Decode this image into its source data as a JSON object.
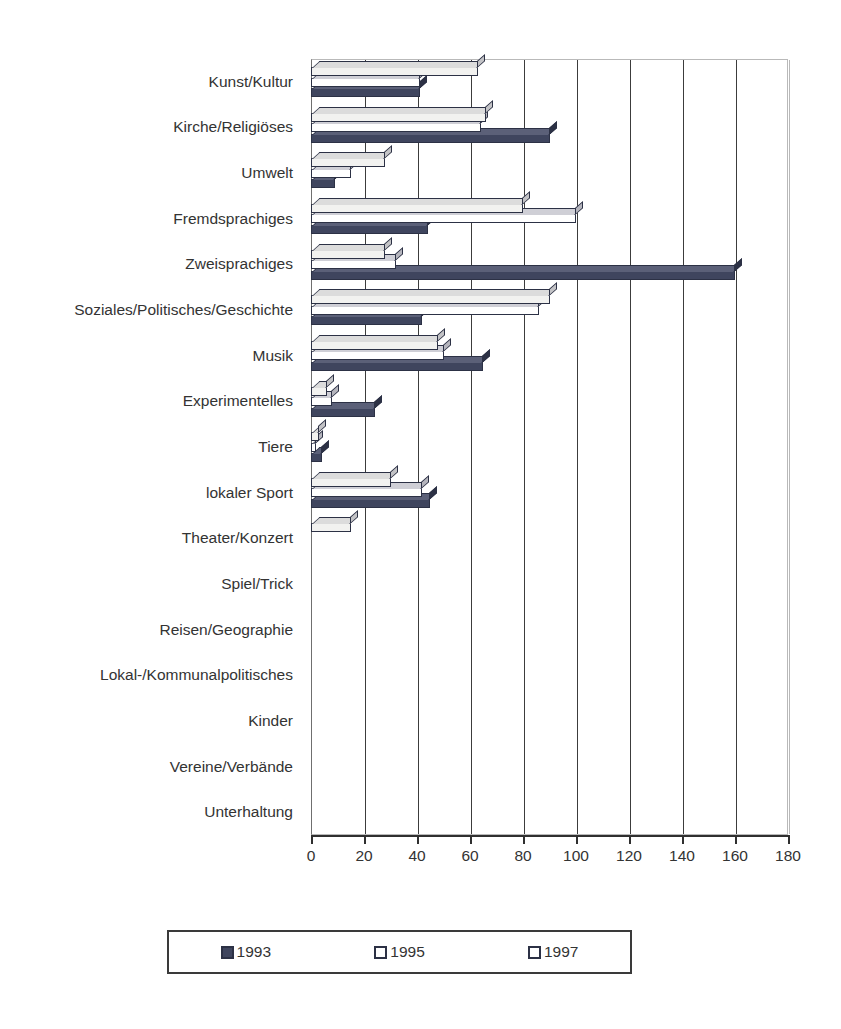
{
  "chart_data": {
    "type": "bar",
    "orientation": "horizontal",
    "title": "",
    "xlabel": "",
    "ylabel": "",
    "xlim": [
      0,
      180
    ],
    "xticks": [
      0,
      20,
      40,
      60,
      80,
      100,
      120,
      140,
      160,
      180
    ],
    "grid": true,
    "legend_position": "bottom",
    "categories": [
      "Kunst/Kultur",
      "Kirche/Religiöses",
      "Umwelt",
      "Fremdsprachiges",
      "Zweisprachiges",
      "Soziales/Politisches/Geschichte",
      "Musik",
      "Experimentelles",
      "Tiere",
      "lokaler Sport",
      "Theater/Konzert",
      "Spiel/Trick",
      "Reisen/Geographie",
      "Lokal-/Kommunalpolitisches",
      "Kinder",
      "Vereine/Verbände",
      "Unterhaltung"
    ],
    "series": [
      {
        "name": "1993",
        "color": "#3f455e",
        "values": [
          41,
          90,
          9,
          44,
          160,
          42,
          65,
          24,
          4,
          45,
          10,
          19,
          40,
          124,
          10,
          29,
          23
        ]
      },
      {
        "name": "1995",
        "color": "#ffffff",
        "values": [
          41,
          64,
          15,
          100,
          32,
          86,
          50,
          8,
          2,
          42,
          12,
          17,
          44,
          127,
          40,
          24,
          65
        ]
      },
      {
        "name": "1997",
        "color": "#f2f2f0",
        "values": [
          63,
          66,
          28,
          80,
          28,
          90,
          48,
          6,
          3,
          30,
          15,
          14,
          42,
          173,
          32,
          53,
          147
        ]
      }
    ]
  },
  "legend": {
    "items": [
      {
        "label": "1993",
        "swatch": "filled-dark-square-icon"
      },
      {
        "label": "1995",
        "swatch": "empty-square-icon"
      },
      {
        "label": "1997",
        "swatch": "empty-square-icon"
      }
    ]
  },
  "axis": {
    "tick_labels": [
      "0",
      "20",
      "40",
      "60",
      "80",
      "100",
      "120",
      "140",
      "160",
      "180"
    ]
  },
  "colors": {
    "series_1993": "#3f455e",
    "series_1995": "#ffffff",
    "series_1997": "#f2f2f0",
    "bar_outline": "#2c3145",
    "gridline": "#3c3c3c",
    "text": "#333333",
    "background": "#ffffff"
  }
}
